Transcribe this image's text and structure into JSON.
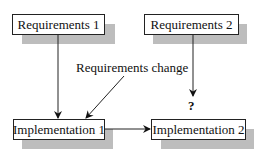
{
  "diagram": {
    "nodes": [
      {
        "id": "req1",
        "label": "Requirements 1"
      },
      {
        "id": "req2",
        "label": "Requirements 2"
      },
      {
        "id": "impl1",
        "label": "Implementation 1"
      },
      {
        "id": "impl2",
        "label": "Implementation 2"
      }
    ],
    "annotations": {
      "requirements_change": "Requirements change",
      "unknown_mark": "?"
    },
    "edges": [
      {
        "from": "req1",
        "to": "impl1"
      },
      {
        "from": "requirements_change",
        "to": "impl1"
      },
      {
        "from": "impl1",
        "to": "impl2"
      },
      {
        "from": "req2",
        "to": "impl2",
        "label": "?"
      }
    ]
  }
}
